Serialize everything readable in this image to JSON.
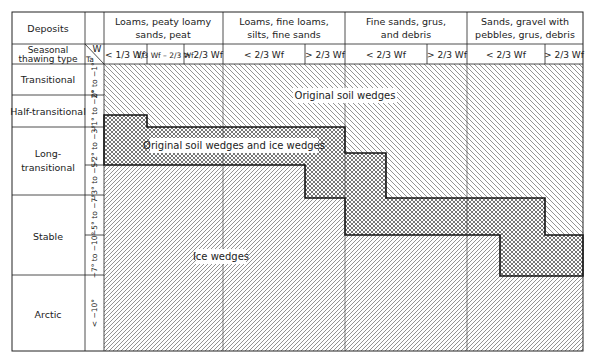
{
  "header": {
    "deposits_label": "Deposits",
    "thawing_label_line1": "Seasonal",
    "thawing_label_line2": "thawing type",
    "axis_w": "W",
    "axis_ta": "Ta"
  },
  "deposit_groups": [
    {
      "line1": "Loams, peaty loamy",
      "line2": "sands, peat"
    },
    {
      "line1": "Loams, fine loams,",
      "line2": "silts, fine sands"
    },
    {
      "line1": "Fine sands, grus,",
      "line2": "and debris"
    },
    {
      "line1": "Sands, gravel with",
      "line2": "pebbles, grus, debris"
    }
  ],
  "moisture_columns": [
    {
      "label": "< 1/3 Wf"
    },
    {
      "label": "1/3 Wf – 2/3 Wf"
    },
    {
      "label": "> 2/3 Wf"
    },
    {
      "label": "< 2/3 Wf"
    },
    {
      "label": "> 2/3 Wf"
    },
    {
      "label": "< 2/3 Wf"
    },
    {
      "label": "> 2/3 Wf"
    },
    {
      "label": "< 2/3 Wf"
    },
    {
      "label": "> 2/3 Wf"
    }
  ],
  "thawing_types": [
    {
      "label": "Transitional"
    },
    {
      "label": "Half-transitional"
    },
    {
      "label_line1": "Long-",
      "label_line2": "transitional"
    },
    {
      "label": "Stable"
    },
    {
      "label": "Arctic"
    }
  ],
  "temperature_ranges": [
    "0° to −1°",
    "−1° to −2°",
    "−2° to −3°",
    "−3° to −5°",
    "−5° to −7°",
    "−7° to −10°",
    "< −10°"
  ],
  "zones": {
    "original_soil_wedges": "Original soil wedges",
    "mixed": "Original soil wedges and ice wedges",
    "ice_wedges": "Ice wedges"
  },
  "frac": {
    "one": "1",
    "two": "2",
    "three": "3",
    "w": "W",
    "f": "f"
  }
}
